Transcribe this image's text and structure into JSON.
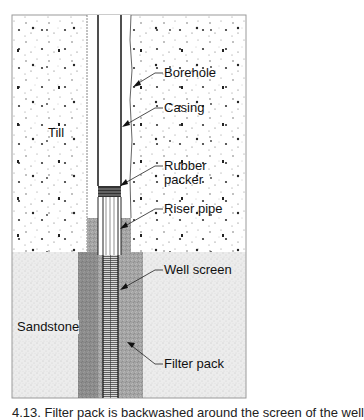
{
  "figure": {
    "layers": [
      {
        "name": "Till",
        "label": "Till",
        "pattern": "sparse-dots",
        "fill": "#ffffff"
      },
      {
        "name": "Sandstone",
        "label": "Sandstone",
        "pattern": "fine-stipple",
        "fill": "#ebebeb"
      }
    ],
    "labels": {
      "borehole": "Borehole",
      "casing": "Casing",
      "rubber_packer_line1": "Rubber",
      "rubber_packer_line2": "packer",
      "riser_pipe": "Riser pipe",
      "well_screen": "Well screen",
      "filter_pack": "Filter pack",
      "till": "Till",
      "sandstone": "Sandstone"
    },
    "caption": "4.13. Filter pack is backwashed around the screen of the well"
  }
}
